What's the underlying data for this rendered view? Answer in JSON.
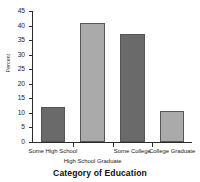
{
  "chart_data": {
    "type": "bar",
    "title": "",
    "xlabel": "Category of Education",
    "ylabel": "Percent",
    "categories": [
      "Some High School",
      "High School Graduate",
      "Some College",
      "College Graduate"
    ],
    "values": [
      12,
      41,
      37,
      10.5
    ],
    "ylim": [
      0,
      45
    ],
    "yticks": [
      0,
      5,
      10,
      15,
      20,
      25,
      30,
      35,
      40,
      45
    ],
    "ytick_labels": [
      "0",
      "5",
      "10",
      "15",
      "20",
      "25",
      "30",
      "35",
      "40",
      "45"
    ],
    "grid": false,
    "legend": null,
    "bar_colors": [
      "#6a6a6a",
      "#aaaaaa",
      "#6a6a6a",
      "#aaaaaa"
    ],
    "bar_edge_color": "#555555",
    "axis_color": "#2b2b2b",
    "background": "#ffffff",
    "label_rows": [
      0,
      1,
      0,
      0
    ]
  }
}
